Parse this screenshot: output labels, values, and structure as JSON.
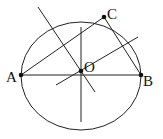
{
  "diagram": {
    "type": "geometry",
    "circle": {
      "cx": 81,
      "cy": 76,
      "rx": 60,
      "ry": 54
    },
    "points": {
      "A": {
        "label": "A",
        "x": 21,
        "y": 75
      },
      "B": {
        "label": "B",
        "x": 141,
        "y": 75
      },
      "C": {
        "label": "C",
        "x": 104,
        "y": 17
      },
      "O": {
        "label": "O",
        "x": 81,
        "y": 71
      }
    },
    "segments": [
      {
        "name": "AB",
        "x1": 21,
        "y1": 75,
        "x2": 141,
        "y2": 75
      },
      {
        "name": "AC",
        "x1": 21,
        "y1": 75,
        "x2": 104,
        "y2": 17
      },
      {
        "name": "BC",
        "x1": 141,
        "y1": 75,
        "x2": 104,
        "y2": 17
      },
      {
        "name": "perp-bisector-AB",
        "x1": 81,
        "y1": 27,
        "x2": 81,
        "y2": 122
      },
      {
        "name": "perp-bisector-AC",
        "x1": 38,
        "y1": 7,
        "x2": 95,
        "y2": 92
      },
      {
        "name": "perp-bisector-BC",
        "x1": 56,
        "y1": 85,
        "x2": 138,
        "y2": 37
      }
    ],
    "labels": {
      "A": "A",
      "B": "B",
      "C": "C",
      "O": "O"
    }
  }
}
